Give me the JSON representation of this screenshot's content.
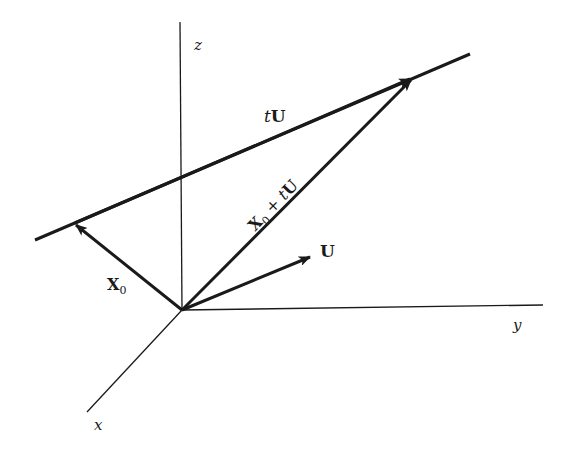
{
  "diagram": {
    "axes": {
      "z": {
        "label": "z"
      },
      "y": {
        "label": "y"
      },
      "x": {
        "label": "x"
      }
    },
    "vectors": {
      "X0": {
        "label_main": "X",
        "label_sub": "0"
      },
      "U": {
        "label": "U"
      },
      "sum": {
        "label_main": "X",
        "label_sub": "0",
        "label_rest": " + tU"
      },
      "tU": {
        "label_t": "t",
        "label_U": "U"
      }
    },
    "colors": {
      "ink": "#1a1a1a",
      "background": "#ffffff"
    }
  }
}
